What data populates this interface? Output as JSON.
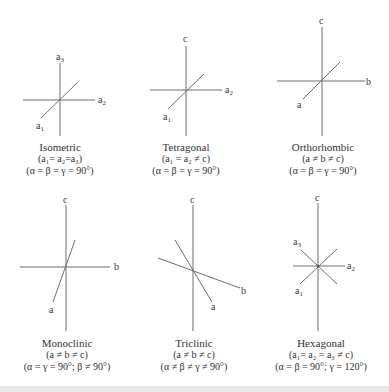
{
  "systems": [
    {
      "name": "Isometric",
      "axis_relation": "(a₁= a₂=a₃)",
      "angle_relation": "(α = β = γ = 90°)",
      "axis_labels": {
        "vertical": "a3",
        "horizontal": "a2",
        "diagonal": "a1"
      }
    },
    {
      "name": "Tetragonal",
      "axis_relation": "(a₁ = a₂ ≠ c)",
      "angle_relation": "(α = β = γ = 90°)",
      "axis_labels": {
        "vertical": "c",
        "horizontal": "a2",
        "diagonal": "a1"
      }
    },
    {
      "name": "Orthorhombic",
      "axis_relation": "(a ≠ b ≠ c)",
      "angle_relation": "(α = β = γ = 90°)",
      "axis_labels": {
        "vertical": "c",
        "horizontal": "b",
        "diagonal": "a"
      }
    },
    {
      "name": "Monoclinic",
      "axis_relation": "(a ≠ b ≠ c)",
      "angle_relation": "(α = γ = 90°; β ≠ 90°)",
      "axis_labels": {
        "vertical": "c",
        "horizontal": "b",
        "diagonal": "a"
      }
    },
    {
      "name": "Triclinic",
      "axis_relation": "(a ≠ b ≠ c)",
      "angle_relation": "(α ≠ β ≠ γ ≠ 90°)",
      "axis_labels": {
        "vertical": "c",
        "horizontal": "b",
        "diagonal": "a"
      }
    },
    {
      "name": "Hexagonal",
      "axis_relation": "(a₁= a₂ = a₃ ≠ c)",
      "angle_relation": "(α = β = 90°; γ = 120°)",
      "axis_labels": {
        "vertical": "c",
        "horizontal": "a2",
        "diagonal_upper": "a3",
        "diagonal_lower": "a1"
      }
    }
  ],
  "colors": {
    "axis_line": "#6e6e6e",
    "text": "#333333",
    "background": "#ffffff",
    "bottom_bar": "#e8e8e8"
  }
}
